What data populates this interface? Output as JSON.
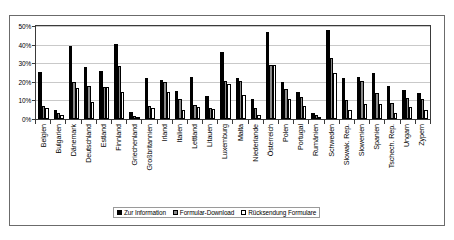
{
  "chart_data": {
    "type": "bar",
    "title": "",
    "xlabel": "",
    "ylabel": "",
    "ylim": [
      0,
      50
    ],
    "yticks": [
      "0%",
      "10%",
      "20%",
      "30%",
      "40%",
      "50%"
    ],
    "ytick_values": [
      0,
      10,
      20,
      30,
      40,
      50
    ],
    "grid": true,
    "legend_position": "bottom",
    "categories": [
      "Belgien",
      "Bulgarien",
      "Dänemark",
      "Deutschland",
      "Estland",
      "Finnland",
      "Griechenland",
      "Großbritannien",
      "Irland",
      "Italien",
      "Lettland",
      "Litauen",
      "Luxemburg",
      "Malta",
      "Niederlande",
      "Österreich",
      "Polen",
      "Portugal",
      "Rumänien",
      "Schweden",
      "Slowak. Rep.",
      "Slowenien",
      "Spanien",
      "Tschech. Rep.",
      "Ungarn",
      "Zypern"
    ],
    "series": [
      {
        "name": "Zur Information",
        "color": "#000000",
        "values": [
          25.5,
          5.0,
          39.0,
          28.0,
          26.0,
          40.5,
          4.0,
          22.0,
          21.0,
          15.0,
          22.5,
          12.5,
          36.0,
          22.0,
          11.0,
          47.0,
          20.0,
          14.5,
          3.5,
          48.0,
          22.0,
          22.5,
          25.0,
          18.0,
          15.5,
          14.0
        ]
      },
      {
        "name": "Formular-Download",
        "color": "#8a8a8a",
        "values": [
          7.0,
          3.5,
          20.0,
          17.5,
          17.0,
          28.5,
          1.5,
          7.0,
          20.0,
          10.5,
          7.5,
          6.0,
          20.5,
          20.5,
          6.0,
          29.0,
          16.0,
          12.0,
          2.0,
          33.0,
          10.0,
          20.5,
          14.0,
          8.5,
          11.5,
          10.5
        ]
      },
      {
        "name": "Rücksendung Formulare",
        "color": "#ffffff",
        "values": [
          6.0,
          2.0,
          16.5,
          9.0,
          17.0,
          14.5,
          1.0,
          6.0,
          14.5,
          5.0,
          6.5,
          5.5,
          19.0,
          13.0,
          2.0,
          29.0,
          11.0,
          7.0,
          1.0,
          24.5,
          5.0,
          8.0,
          8.0,
          3.0,
          6.5,
          5.0
        ]
      }
    ]
  }
}
